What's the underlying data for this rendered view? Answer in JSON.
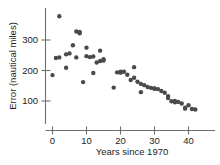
{
  "chart_data": {
    "type": "scatter",
    "title": "",
    "xlabel": "Years since 1970",
    "ylabel": "Error (nautical miles)",
    "xlim": [
      -2,
      43
    ],
    "ylim": [
      40,
      400
    ],
    "grid": false,
    "legend": null,
    "x_ticks": [
      0,
      10,
      20,
      30,
      40
    ],
    "x_tick_labels": [
      "0",
      "10",
      "20",
      "30",
      "40"
    ],
    "y_ticks": [
      100,
      200,
      300
    ],
    "y_tick_labels": [
      "100",
      "200",
      "300"
    ],
    "marker": {
      "shape": "circle",
      "color": "#4a4a4a",
      "size_px": 2.6
    },
    "series": [
      {
        "name": "Hurricane track forecast error",
        "points": [
          {
            "x": 0,
            "y": 185
          },
          {
            "x": 1,
            "y": 241
          },
          {
            "x": 2,
            "y": 243
          },
          {
            "x": 2,
            "y": 378
          },
          {
            "x": 4,
            "y": 209
          },
          {
            "x": 4,
            "y": 253
          },
          {
            "x": 5,
            "y": 256
          },
          {
            "x": 6,
            "y": 283
          },
          {
            "x": 7,
            "y": 328
          },
          {
            "x": 7,
            "y": 243
          },
          {
            "x": 8,
            "y": 326
          },
          {
            "x": 8,
            "y": 322
          },
          {
            "x": 9,
            "y": 162
          },
          {
            "x": 10,
            "y": 275
          },
          {
            "x": 10,
            "y": 247
          },
          {
            "x": 11,
            "y": 244
          },
          {
            "x": 12,
            "y": 246
          },
          {
            "x": 12,
            "y": 192
          },
          {
            "x": 13,
            "y": 226
          },
          {
            "x": 14,
            "y": 265
          },
          {
            "x": 14,
            "y": 231
          },
          {
            "x": 15,
            "y": 237
          },
          {
            "x": 15,
            "y": 233
          },
          {
            "x": 18,
            "y": 144
          },
          {
            "x": 19,
            "y": 194
          },
          {
            "x": 20,
            "y": 196
          },
          {
            "x": 20,
            "y": 193
          },
          {
            "x": 21,
            "y": 196
          },
          {
            "x": 22,
            "y": 186
          },
          {
            "x": 23,
            "y": 169
          },
          {
            "x": 24,
            "y": 211
          },
          {
            "x": 24,
            "y": 176
          },
          {
            "x": 25,
            "y": 163
          },
          {
            "x": 26,
            "y": 129
          },
          {
            "x": 26,
            "y": 156
          },
          {
            "x": 27,
            "y": 152
          },
          {
            "x": 28,
            "y": 146
          },
          {
            "x": 29,
            "y": 143
          },
          {
            "x": 30,
            "y": 141
          },
          {
            "x": 30,
            "y": 140
          },
          {
            "x": 31,
            "y": 139
          },
          {
            "x": 32,
            "y": 133
          },
          {
            "x": 33,
            "y": 127
          },
          {
            "x": 34,
            "y": 116
          },
          {
            "x": 34,
            "y": 110
          },
          {
            "x": 35,
            "y": 99
          },
          {
            "x": 36,
            "y": 100
          },
          {
            "x": 36,
            "y": 96
          },
          {
            "x": 37,
            "y": 97
          },
          {
            "x": 38,
            "y": 92
          },
          {
            "x": 39,
            "y": 78
          },
          {
            "x": 39,
            "y": 75
          },
          {
            "x": 40,
            "y": 86
          },
          {
            "x": 41,
            "y": 74
          },
          {
            "x": 42,
            "y": 72
          }
        ]
      }
    ]
  }
}
